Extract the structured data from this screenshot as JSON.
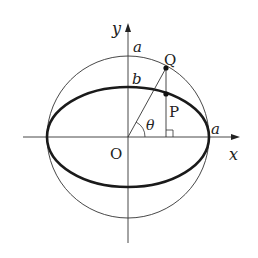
{
  "diagram": {
    "labels": {
      "y_axis": "y",
      "x_axis": "x",
      "origin": "O",
      "circle_radius_top": "a",
      "circle_radius_right": "a",
      "semi_minor": "b",
      "point_q": "Q",
      "point_p": "P",
      "angle": "θ"
    },
    "geometry": {
      "center": [
        128,
        137
      ],
      "circle_radius": 81,
      "ellipse_rx": 81,
      "ellipse_ry": 50,
      "angle_deg": 62
    },
    "colors": {
      "stroke": "#1a1a1a",
      "thin_stroke": "#333333",
      "background": "#ffffff"
    }
  }
}
